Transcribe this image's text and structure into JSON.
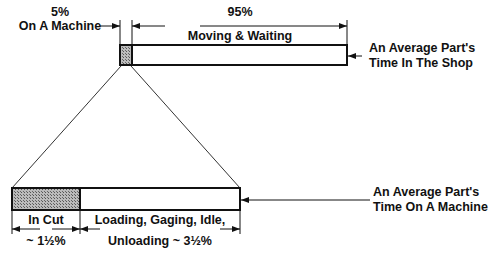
{
  "top_bar": {
    "left_pct": "5%",
    "left_label": "On A Machine",
    "right_pct": "95%",
    "right_label": "Moving & Waiting",
    "callout_line1": "An Average Part's",
    "callout_line2": "Time In The Shop"
  },
  "bottom_bar": {
    "left_label": "In Cut",
    "left_pct": "~ 1½%",
    "right_label_line1": "Loading, Gaging, Idle,",
    "right_label_line2": "Unloading ~ 3½%",
    "callout_line1": "An Average Part's",
    "callout_line2": "Time On A Machine"
  },
  "colors": {
    "line": "#111111",
    "hatch": "#888888",
    "background": "#ffffff"
  }
}
